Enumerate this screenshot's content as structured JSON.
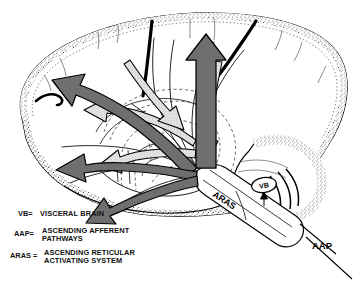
{
  "figure": {
    "background_color": "#ffffff",
    "outline_color": "#000000",
    "stipple_color": "#3a3a3a",
    "dark_arrow_fill": "#6f6f6f",
    "light_arrow_fill": "#d9d9d9",
    "dashed_line_color": "#555555"
  },
  "labels": {
    "aras": "ARAS",
    "vb": "VB",
    "aap": "AAP"
  },
  "legend": {
    "items": [
      {
        "abbr": "VB=",
        "lines": [
          "VISCERAL BRAIN"
        ]
      },
      {
        "abbr": "AAP=",
        "lines": [
          "ASCENDING AFFERENT",
          "PATHWAYS"
        ]
      },
      {
        "abbr": "ARAS =",
        "lines": [
          "ASCENDING RETICULAR",
          "ACTIVATING SYSTEM"
        ]
      }
    ]
  },
  "arrows": {
    "dark": [
      {
        "name": "arrow-to-frontal-superior",
        "direction": "left-up",
        "target": "frontal cortex"
      },
      {
        "name": "arrow-to-frontal-inferior",
        "direction": "left",
        "target": "frontal cortex"
      },
      {
        "name": "arrow-to-orbital",
        "direction": "left-down",
        "target": "orbitofrontal region"
      },
      {
        "name": "arrow-to-vertex",
        "direction": "up",
        "target": "superior cortex"
      }
    ],
    "light": [
      {
        "name": "arrow-light-mid",
        "direction": "left",
        "target": "mid cortex"
      },
      {
        "name": "arrow-light-lower",
        "direction": "left",
        "target": "lower cortex"
      },
      {
        "name": "arrow-light-descending",
        "direction": "down",
        "target": "brainstem"
      },
      {
        "name": "arrow-light-ascending-parietal",
        "direction": "down-left",
        "target": "parietal region"
      }
    ]
  }
}
